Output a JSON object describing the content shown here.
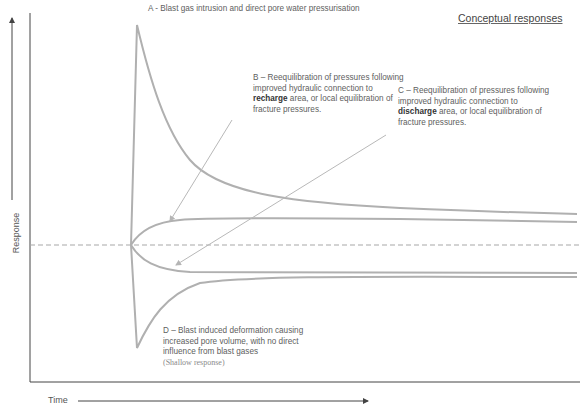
{
  "diagram": {
    "title": "Conceptual responses",
    "axes": {
      "y_label": "Response",
      "x_label": "Time"
    },
    "annotations": {
      "A": {
        "text": "A - Blast gas intrusion and direct pore water pressurisation"
      },
      "B": {
        "line1": "B – Reequilibration of pressures following",
        "line2": "improved hydraulic connection to",
        "bold": "recharge",
        "line3_rest": " area, or local equilibration of",
        "line4": "fracture pressures."
      },
      "C": {
        "line1": "C – Reequilibration of pressures following",
        "line2": "improved hydraulic connection to",
        "bold": "discharge",
        "line3_rest": " area, or local equilibration of",
        "line4": "fracture pressures."
      },
      "D": {
        "line1": "D – Blast induced deformation causing",
        "line2": "increased pore volume, with no direct",
        "line3": "influence from blast gases",
        "line4": "(Shallow response)"
      }
    },
    "colors": {
      "curve": "#b0b0b0",
      "baseline_dashed": "#a8a8a8",
      "axis": "#444444",
      "arrow": "#b8b8b8"
    }
  }
}
